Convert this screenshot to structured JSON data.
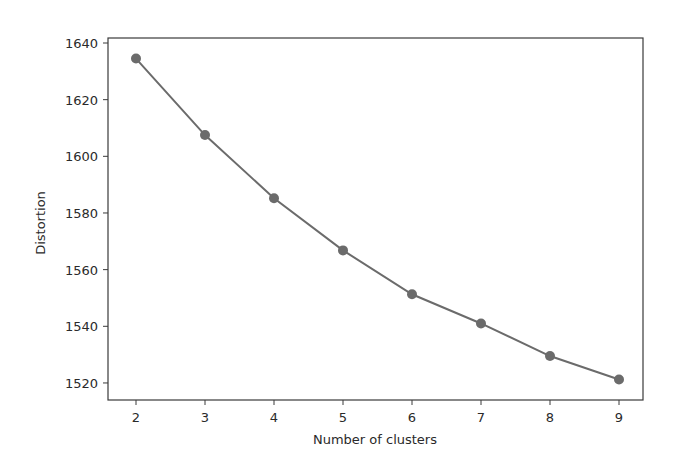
{
  "chart_data": {
    "type": "line",
    "title": "",
    "xlabel": "Number of clusters",
    "ylabel": "Distortion",
    "x": [
      2,
      3,
      4,
      5,
      6,
      7,
      8,
      9
    ],
    "series": [
      {
        "name": "Distortion",
        "values": [
          1634.5,
          1607.5,
          1585.2,
          1566.8,
          1551.3,
          1541.0,
          1529.5,
          1521.2
        ],
        "color": "#6b6b6b",
        "marker": "circle"
      }
    ],
    "xticks": [
      "2",
      "3",
      "4",
      "5",
      "6",
      "7",
      "8",
      "9"
    ],
    "yticks": [
      "1520",
      "1540",
      "1560",
      "1580",
      "1600",
      "1620",
      "1640"
    ],
    "xlim": [
      1.65,
      9.35
    ],
    "ylim": [
      1514.5,
      1641
    ],
    "grid": false,
    "legend": false
  }
}
